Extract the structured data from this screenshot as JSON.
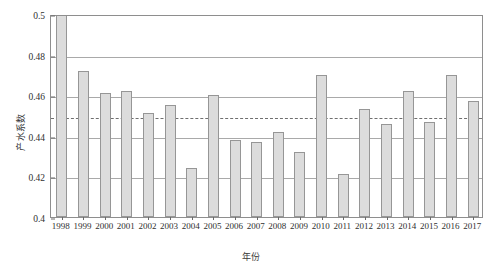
{
  "chart_data": {
    "type": "bar",
    "title": "",
    "xlabel": "年份",
    "ylabel": "产水系数",
    "categories": [
      "1998",
      "1999",
      "2000",
      "2001",
      "2002",
      "2003",
      "2004",
      "2005",
      "2006",
      "2007",
      "2008",
      "2009",
      "2010",
      "2011",
      "2012",
      "2013",
      "2014",
      "2015",
      "2016",
      "2017"
    ],
    "values": [
      0.503,
      0.472,
      0.461,
      0.462,
      0.451,
      0.455,
      0.424,
      0.46,
      0.438,
      0.437,
      0.442,
      0.432,
      0.47,
      0.421,
      0.453,
      0.446,
      0.462,
      0.447,
      0.47,
      0.457
    ],
    "ylim": [
      0.4,
      0.5
    ],
    "xlim_note": "categorical",
    "yticks": [
      0.4,
      0.42,
      0.44,
      0.46,
      0.48,
      0.5
    ],
    "ytick_labels": [
      "0.4",
      "0.42",
      "0.44",
      "0.46",
      "0.48",
      "0.5"
    ],
    "grid": true,
    "grid_axis": "y",
    "legend": null,
    "annotations": [
      {
        "type": "reference-line",
        "orientation": "horizontal",
        "value": 0.45,
        "style": "dashed",
        "label": ""
      }
    ],
    "clipped_bars": [
      "1998"
    ],
    "series_color": "#dcdcdc",
    "series_edge_color": "#969696",
    "grid_color": "#a9a9a9",
    "refline_color": "#6f6f6f"
  }
}
